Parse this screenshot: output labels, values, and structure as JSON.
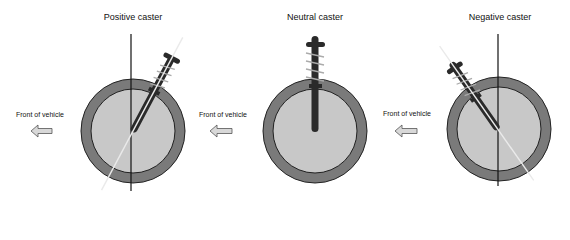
{
  "panels": [
    {
      "title": "Positive caster",
      "front_label": "Front of vehicle",
      "center": [
        133,
        131
      ],
      "axis_x": 131,
      "strut_angle_deg": 28
    },
    {
      "title": "Neutral caster",
      "front_label": "Front of vehicle",
      "center": [
        315,
        131
      ],
      "axis_x": 315,
      "strut_angle_deg": 0
    },
    {
      "title": "Negative caster",
      "front_label": "Front of vehicle",
      "center": [
        499,
        129
      ],
      "axis_x": 498,
      "strut_angle_deg": -35
    }
  ],
  "colors": {
    "tire": "#7a7a7a",
    "hub": "#c8c8c8",
    "outline": "#222222",
    "strut": "#2a2a2a",
    "steering_axis": "#e6e6e6",
    "arrow_fill": "#d8d8d8"
  }
}
